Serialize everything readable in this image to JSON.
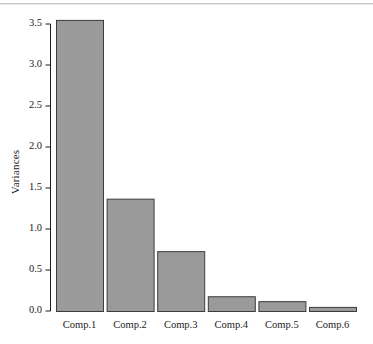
{
  "chart_data": {
    "type": "bar",
    "title": "",
    "subtitle": "",
    "xlabel": "",
    "ylabel": "Variances",
    "categories": [
      "Comp.1",
      "Comp.2",
      "Comp.3",
      "Comp.4",
      "Comp.5",
      "Comp.6"
    ],
    "values": [
      3.55,
      1.37,
      0.73,
      0.18,
      0.12,
      0.05
    ],
    "ylim": [
      0.0,
      3.5
    ],
    "yticks": [
      0.0,
      0.5,
      1.0,
      1.5,
      2.0,
      2.5,
      3.0,
      3.5
    ],
    "ytick_labels": [
      "0.0",
      "0.5",
      "1.0",
      "1.5",
      "2.0",
      "2.5",
      "3.0",
      "3.5"
    ],
    "grid": false,
    "legend": null,
    "legend_position": "none",
    "bar_fill_color": "#9a9a9a",
    "bar_border_color": "#3c3c3c",
    "axis_color": "#1b1b1b",
    "background_color": "#ffffff"
  },
  "axes": {
    "y_axis_title": "Variances",
    "x_axis_title": ""
  },
  "figure": {
    "top_rule_color": "#c9ccd0"
  }
}
